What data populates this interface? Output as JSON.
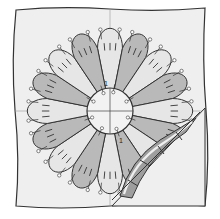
{
  "diagram": {
    "colors": {
      "background": "#ffffff",
      "fabric": "#efefef",
      "petal_light": "#e6e6e6",
      "petal_dark": "#b9b9b9",
      "center": "#f2f2f2",
      "outline": "#333333",
      "fold_back": "#9e9e9e",
      "pin_head": "#ffffff"
    },
    "block": {
      "x": 14,
      "y": 10,
      "width": 192,
      "height": 196
    },
    "plate": {
      "cx": 110,
      "cy": 111,
      "outer_r": 82,
      "inner_r": 23,
      "petals": 16
    },
    "labels": {
      "center_mark": "1",
      "fold_mark": "1"
    }
  }
}
